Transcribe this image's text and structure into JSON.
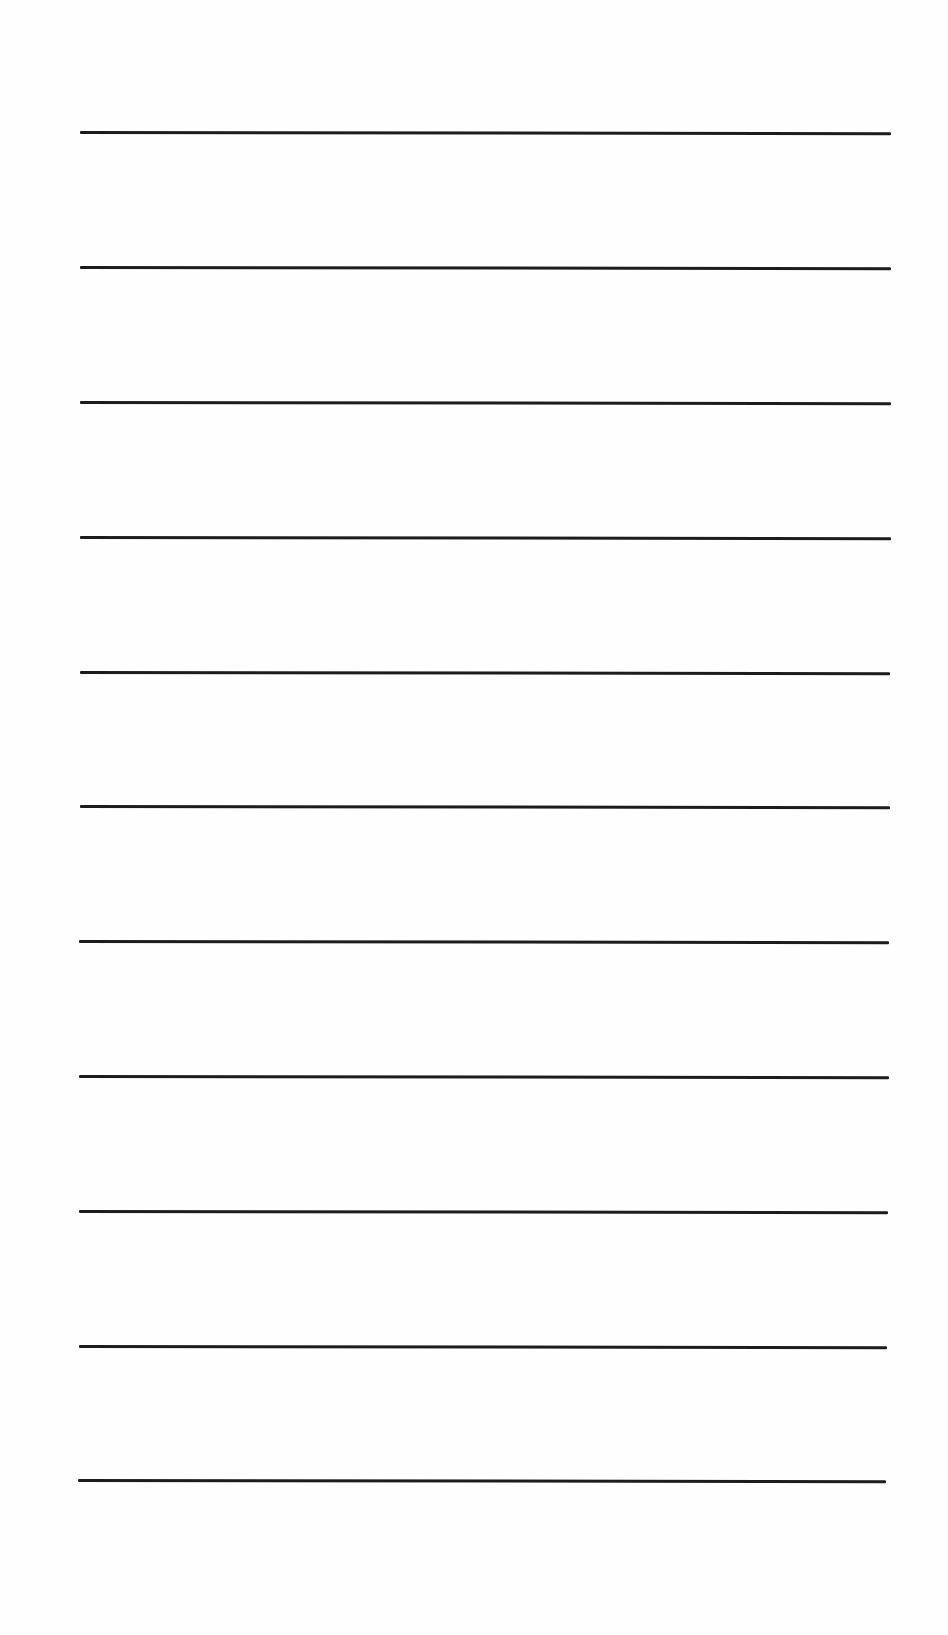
{
  "page": {
    "type": "blank-lined-sheet",
    "background_color": "#fefefe",
    "line_color": "#1c1c1c",
    "line_thickness_px": 3,
    "line_count": 11
  },
  "lines": [
    {
      "y": 132,
      "x1": 80,
      "x2": 891
    },
    {
      "y": 267,
      "x1": 80,
      "x2": 891
    },
    {
      "y": 402,
      "x1": 80,
      "x2": 891
    },
    {
      "y": 537,
      "x1": 80,
      "x2": 891
    },
    {
      "y": 672,
      "x1": 80,
      "x2": 890
    },
    {
      "y": 806,
      "x1": 80,
      "x2": 890
    },
    {
      "y": 941,
      "x1": 79,
      "x2": 889
    },
    {
      "y": 1076,
      "x1": 79,
      "x2": 889
    },
    {
      "y": 1211,
      "x1": 79,
      "x2": 888
    },
    {
      "y": 1346,
      "x1": 79,
      "x2": 887
    },
    {
      "y": 1480,
      "x1": 78,
      "x2": 886
    }
  ]
}
